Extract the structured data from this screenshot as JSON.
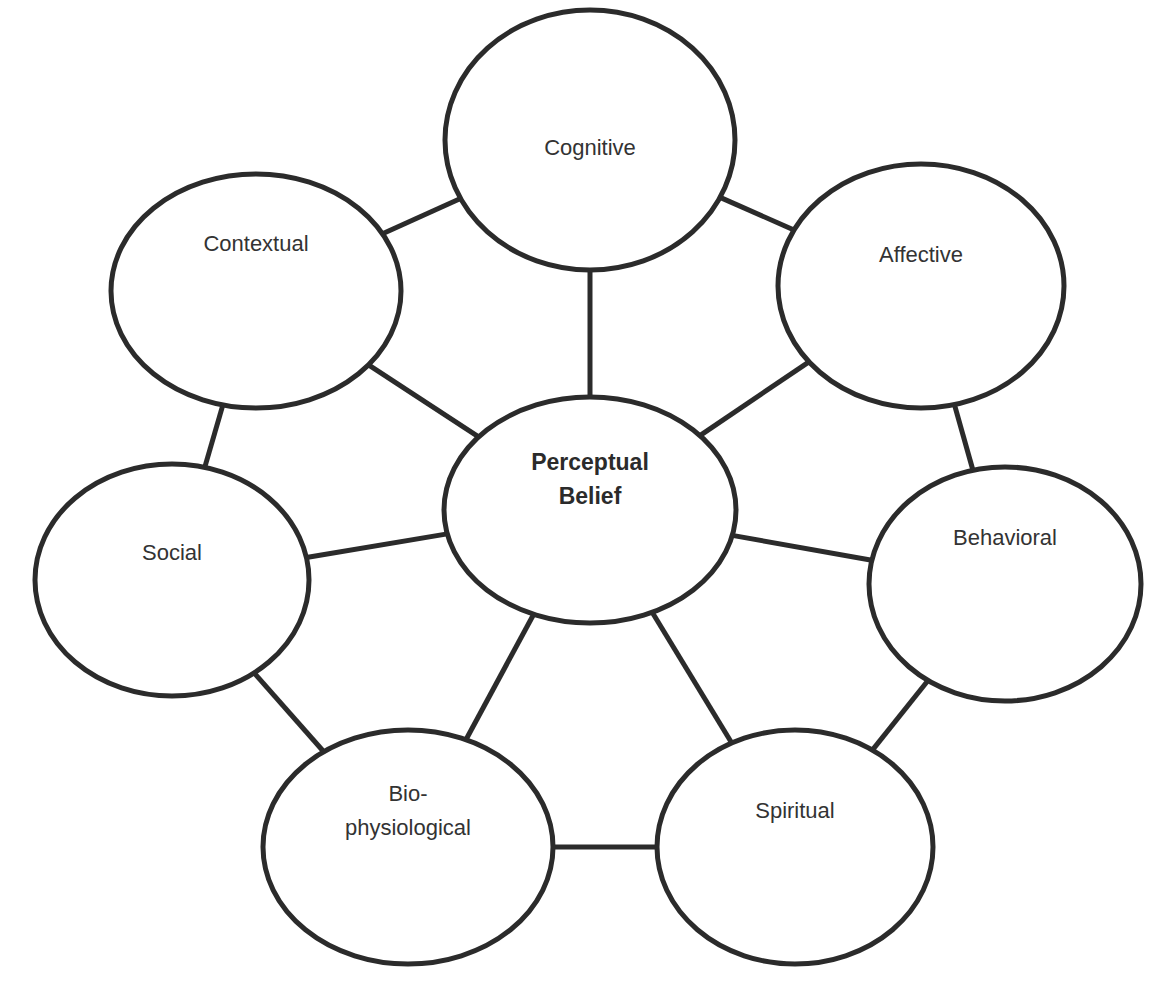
{
  "diagram": {
    "center": {
      "id": "perceptual",
      "lines": [
        "Perceptual",
        "Belief"
      ],
      "bold": true
    },
    "nodes": [
      {
        "id": "cognitive",
        "lines": [
          "Cognitive"
        ]
      },
      {
        "id": "affective",
        "lines": [
          "Affective"
        ]
      },
      {
        "id": "behavioral",
        "lines": [
          "Behavioral"
        ]
      },
      {
        "id": "spiritual",
        "lines": [
          "Spiritual"
        ]
      },
      {
        "id": "biophysiological",
        "lines": [
          "Bio-",
          "physiological"
        ]
      },
      {
        "id": "social",
        "lines": [
          "Social"
        ]
      },
      {
        "id": "contextual",
        "lines": [
          "Contextual"
        ]
      }
    ],
    "edges": [
      [
        "perceptual",
        "cognitive"
      ],
      [
        "perceptual",
        "affective"
      ],
      [
        "perceptual",
        "behavioral"
      ],
      [
        "perceptual",
        "spiritual"
      ],
      [
        "perceptual",
        "biophysiological"
      ],
      [
        "perceptual",
        "social"
      ],
      [
        "perceptual",
        "contextual"
      ],
      [
        "cognitive",
        "affective"
      ],
      [
        "affective",
        "behavioral"
      ],
      [
        "behavioral",
        "spiritual"
      ],
      [
        "spiritual",
        "biophysiological"
      ],
      [
        "biophysiological",
        "social"
      ],
      [
        "social",
        "contextual"
      ],
      [
        "contextual",
        "cognitive"
      ]
    ]
  }
}
